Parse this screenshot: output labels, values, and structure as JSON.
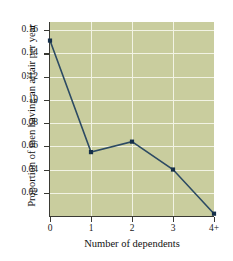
{
  "chart_data": {
    "type": "line",
    "title": "",
    "xlabel": "Number of dependents",
    "ylabel": "Proportion of men having an affair per year",
    "categories": [
      "0",
      "1",
      "2",
      "3",
      "4+"
    ],
    "values": [
      0.151,
      0.055,
      0.064,
      0.04,
      0.002
    ],
    "x": [
      0,
      1,
      2,
      3,
      4
    ],
    "xlim": [
      0,
      4
    ],
    "ylim": [
      0,
      0.167
    ],
    "ytick_labels": [
      "0.02",
      "0.04",
      "0.06",
      "0.08",
      "0.10",
      "0.12",
      "0.14",
      "0.16"
    ],
    "ytick_values": [
      0.02,
      0.04,
      0.06,
      0.08,
      0.1,
      0.12,
      0.14,
      0.16
    ],
    "xtick_labels": [
      "0",
      "1",
      "2",
      "3",
      "4+"
    ],
    "grid": true,
    "legend": "none",
    "marker": "square",
    "colors": {
      "plot_background": "#c9cd9e",
      "gridline": "#f2f3e4",
      "line": "#2c4a63",
      "marker": "#16304a",
      "axis": "#3a3a34",
      "text": "#1b1b1b",
      "page_background": "#ffffff"
    }
  }
}
